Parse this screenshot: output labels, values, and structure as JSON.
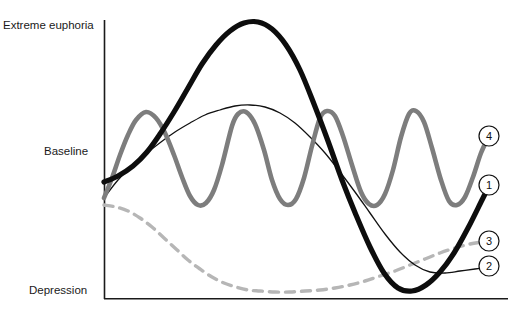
{
  "figure": {
    "background_color": "#ffffff",
    "width": 514,
    "height": 318
  },
  "axes": {
    "color": "#1a1a1a",
    "origin_x": 104,
    "top_y": 20,
    "bottom_y": 299,
    "right_x": 508,
    "y_labels": [
      {
        "id": "euphoria",
        "text": "Extreme euphoria",
        "value_y": 20
      },
      {
        "id": "baseline",
        "text": "Baseline",
        "value_y": 152
      },
      {
        "id": "depression",
        "text": "Depression",
        "value_y": 292
      }
    ]
  },
  "series_markers": [
    {
      "id": "marker-1",
      "label": "1",
      "cx": 489,
      "cy": 185,
      "series": "course-1-thick-black"
    },
    {
      "id": "marker-2",
      "label": "2",
      "cx": 489,
      "cy": 266,
      "series": "course-2-thin-black"
    },
    {
      "id": "marker-3",
      "label": "3",
      "cx": 489,
      "cy": 241,
      "series": "course-3-dashed-gray"
    },
    {
      "id": "marker-4",
      "label": "4",
      "cx": 489,
      "cy": 136,
      "series": "course-4-solid-gray"
    }
  ],
  "chart_data": {
    "type": "line",
    "title": "",
    "xlabel": "",
    "ylabel": "",
    "grid": false,
    "legend_position": "right-inline-circled-numbers",
    "y_axis": {
      "tick_labels": [
        "Extreme euphoria",
        "Baseline",
        "Depression"
      ],
      "tick_pixel_y": [
        20,
        152,
        292
      ],
      "range_description": "Depression (low) to Extreme euphoria (high)"
    },
    "x_axis": {
      "tick_labels": [],
      "range_description": "time (unlabeled)"
    },
    "series": [
      {
        "name": "1",
        "style": "thick solid black",
        "color": "#0d0d0d",
        "width": 5.2,
        "points_xy": [
          [
            104,
            182
          ],
          [
            118,
            176
          ],
          [
            133,
            166
          ],
          [
            147,
            152
          ],
          [
            160,
            134
          ],
          [
            174,
            112
          ],
          [
            188,
            88
          ],
          [
            202,
            64
          ],
          [
            216,
            45
          ],
          [
            230,
            31
          ],
          [
            244,
            23
          ],
          [
            258,
            22
          ],
          [
            272,
            29
          ],
          [
            286,
            45
          ],
          [
            300,
            70
          ],
          [
            314,
            104
          ],
          [
            328,
            141
          ],
          [
            342,
            180
          ],
          [
            356,
            215
          ],
          [
            370,
            247
          ],
          [
            384,
            273
          ],
          [
            398,
            288
          ],
          [
            412,
            291
          ],
          [
            426,
            285
          ],
          [
            440,
            272
          ],
          [
            454,
            253
          ],
          [
            468,
            228
          ],
          [
            482,
            200
          ],
          [
            489,
            186
          ]
        ]
      },
      {
        "name": "2",
        "style": "thin solid black",
        "color": "#111111",
        "width": 1.3,
        "points_xy": [
          [
            104,
            198
          ],
          [
            118,
            180
          ],
          [
            133,
            165
          ],
          [
            147,
            153
          ],
          [
            161,
            142
          ],
          [
            175,
            132
          ],
          [
            190,
            123
          ],
          [
            205,
            115
          ],
          [
            220,
            110
          ],
          [
            235,
            106
          ],
          [
            250,
            105
          ],
          [
            265,
            107
          ],
          [
            280,
            113
          ],
          [
            295,
            123
          ],
          [
            310,
            137
          ],
          [
            325,
            153
          ],
          [
            340,
            172
          ],
          [
            355,
            192
          ],
          [
            370,
            213
          ],
          [
            385,
            234
          ],
          [
            400,
            252
          ],
          [
            415,
            265
          ],
          [
            430,
            272
          ],
          [
            445,
            273
          ],
          [
            460,
            271
          ],
          [
            475,
            269
          ],
          [
            489,
            267
          ]
        ]
      },
      {
        "name": "3",
        "style": "dashed gray",
        "color": "#b6b6b6",
        "width": 3.4,
        "dash": "9 7",
        "points_xy": [
          [
            104,
            205
          ],
          [
            116,
            207
          ],
          [
            128,
            211
          ],
          [
            140,
            218
          ],
          [
            152,
            227
          ],
          [
            164,
            238
          ],
          [
            176,
            249
          ],
          [
            188,
            260
          ],
          [
            200,
            269
          ],
          [
            212,
            277
          ],
          [
            224,
            283
          ],
          [
            236,
            287
          ],
          [
            248,
            290
          ],
          [
            260,
            291
          ],
          [
            275,
            292
          ],
          [
            290,
            292
          ],
          [
            305,
            291
          ],
          [
            320,
            290
          ],
          [
            335,
            288
          ],
          [
            350,
            285
          ],
          [
            365,
            281
          ],
          [
            380,
            276
          ],
          [
            395,
            271
          ],
          [
            410,
            265
          ],
          [
            425,
            259
          ],
          [
            440,
            253
          ],
          [
            455,
            248
          ],
          [
            470,
            244
          ],
          [
            489,
            241
          ]
        ]
      },
      {
        "name": "4",
        "style": "thick solid gray (oscillating)",
        "color": "#7d7d7d",
        "width": 4.6,
        "description": "regular oscillation between just above baseline and below baseline, 4 full cycles then rising",
        "peaks_x": [
          146,
          232,
          320,
          406
        ],
        "troughs_x": [
          190,
          276,
          363,
          449
        ],
        "peak_y": 111,
        "trough_y": 205,
        "points_xy": [
          [
            104,
            198
          ],
          [
            112,
            178
          ],
          [
            120,
            155
          ],
          [
            128,
            135
          ],
          [
            136,
            120
          ],
          [
            146,
            112
          ],
          [
            156,
            118
          ],
          [
            165,
            133
          ],
          [
            174,
            155
          ],
          [
            182,
            177
          ],
          [
            190,
            196
          ],
          [
            198,
            205
          ],
          [
            206,
            203
          ],
          [
            214,
            190
          ],
          [
            222,
            165
          ],
          [
            232,
            126
          ],
          [
            238,
            114
          ],
          [
            246,
            112
          ],
          [
            255,
            124
          ],
          [
            264,
            150
          ],
          [
            272,
            180
          ],
          [
            280,
            199
          ],
          [
            288,
            205
          ],
          [
            296,
            199
          ],
          [
            304,
            178
          ],
          [
            312,
            146
          ],
          [
            320,
            118
          ],
          [
            327,
            111
          ],
          [
            335,
            116
          ],
          [
            343,
            136
          ],
          [
            352,
            165
          ],
          [
            361,
            192
          ],
          [
            369,
            204
          ],
          [
            377,
            205
          ],
          [
            385,
            194
          ],
          [
            393,
            170
          ],
          [
            401,
            137
          ],
          [
            409,
            114
          ],
          [
            416,
            111
          ],
          [
            424,
            122
          ],
          [
            432,
            148
          ],
          [
            441,
            180
          ],
          [
            449,
            201
          ],
          [
            457,
            205
          ],
          [
            465,
            197
          ],
          [
            473,
            177
          ],
          [
            481,
            153
          ],
          [
            489,
            136
          ]
        ]
      }
    ]
  }
}
